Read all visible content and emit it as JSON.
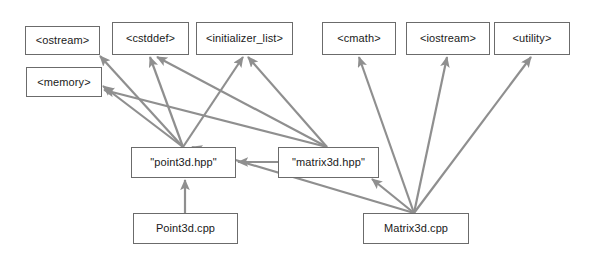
{
  "diagram": {
    "type": "include-dependency-graph",
    "title": "",
    "canvas": {
      "width": 591,
      "height": 265
    },
    "style": {
      "background": "#ffffff",
      "node_fill": "#ffffff",
      "node_border": "#6b6b6b",
      "node_text": "#1a1a1a",
      "edge_color": "#8f8f8f",
      "edge_width": 2.2
    },
    "nodes": [
      {
        "id": "ostream",
        "label": "<ostream>",
        "x": 25,
        "y": 26,
        "w": 75,
        "h": 29
      },
      {
        "id": "cstddef",
        "label": "<cstddef>",
        "x": 112,
        "y": 22,
        "w": 77,
        "h": 33
      },
      {
        "id": "initializer_list",
        "label": "<initializer_list>",
        "x": 196,
        "y": 22,
        "w": 97,
        "h": 33
      },
      {
        "id": "cmath",
        "label": "<cmath>",
        "x": 322,
        "y": 22,
        "w": 74,
        "h": 33
      },
      {
        "id": "iostream",
        "label": "<iostream>",
        "x": 406,
        "y": 22,
        "w": 84,
        "h": 33
      },
      {
        "id": "utility",
        "label": "<utility>",
        "x": 494,
        "y": 22,
        "w": 76,
        "h": 33
      },
      {
        "id": "memory",
        "label": "<memory>",
        "x": 26,
        "y": 67,
        "w": 76,
        "h": 30
      },
      {
        "id": "point3d_hpp",
        "label": "\"point3d.hpp\"",
        "x": 131,
        "y": 147,
        "w": 105,
        "h": 31
      },
      {
        "id": "matrix3d_hpp",
        "label": "\"matrix3d.hpp\"",
        "x": 278,
        "y": 147,
        "w": 101,
        "h": 31
      },
      {
        "id": "point3d_cpp",
        "label": "Point3d.cpp",
        "x": 133,
        "y": 213,
        "w": 105,
        "h": 31
      },
      {
        "id": "matrix3d_cpp",
        "label": "Matrix3d.cpp",
        "x": 363,
        "y": 213,
        "w": 106,
        "h": 31
      }
    ],
    "edges": [
      {
        "from": "point3d_hpp",
        "to": "ostream",
        "x1": 183,
        "y1": 147,
        "x2": 100,
        "y2": 56
      },
      {
        "from": "point3d_hpp",
        "to": "cstddef",
        "x1": 183,
        "y1": 147,
        "x2": 150,
        "y2": 57
      },
      {
        "from": "point3d_hpp",
        "to": "initializer_list",
        "x1": 183,
        "y1": 147,
        "x2": 243,
        "y2": 57
      },
      {
        "from": "point3d_hpp",
        "to": "memory",
        "x1": 183,
        "y1": 147,
        "x2": 103,
        "y2": 86
      },
      {
        "from": "matrix3d_hpp",
        "to": "point3d_hpp",
        "x1": 278,
        "y1": 162,
        "x2": 238,
        "y2": 162
      },
      {
        "from": "matrix3d_hpp",
        "to": "cstddef",
        "x1": 327,
        "y1": 147,
        "x2": 157,
        "y2": 57
      },
      {
        "from": "matrix3d_hpp",
        "to": "initializer_list",
        "x1": 327,
        "y1": 147,
        "x2": 248,
        "y2": 57
      },
      {
        "from": "matrix3d_hpp",
        "to": "memory",
        "x1": 327,
        "y1": 147,
        "x2": 104,
        "y2": 90
      },
      {
        "from": "point3d_cpp",
        "to": "point3d_hpp",
        "x1": 185,
        "y1": 213,
        "x2": 185,
        "y2": 180
      },
      {
        "from": "matrix3d_cpp",
        "to": "matrix3d_hpp",
        "x1": 414,
        "y1": 213,
        "x2": 372,
        "y2": 179
      },
      {
        "from": "matrix3d_cpp",
        "to": "cmath",
        "x1": 414,
        "y1": 213,
        "x2": 359,
        "y2": 57
      },
      {
        "from": "matrix3d_cpp",
        "to": "iostream",
        "x1": 414,
        "y1": 213,
        "x2": 447,
        "y2": 57
      },
      {
        "from": "matrix3d_cpp",
        "to": "utility",
        "x1": 414,
        "y1": 213,
        "x2": 531,
        "y2": 57
      },
      {
        "from": "matrix3d_cpp",
        "to": "point3d_hpp",
        "x1": 414,
        "y1": 213,
        "x2": 192,
        "y2": 147
      }
    ]
  }
}
